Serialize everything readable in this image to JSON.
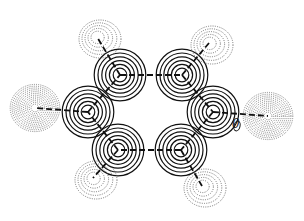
{
  "figure": {
    "type": "contour-map",
    "contour_label": "0",
    "line_color": "#111111",
    "negative_contour_color": "#555555"
  },
  "atoms": [
    {
      "id": "C1",
      "x": 120,
      "y": 75,
      "kind": "ring",
      "rings": 6
    },
    {
      "id": "C2",
      "x": 182,
      "y": 75,
      "kind": "ring",
      "rings": 6
    },
    {
      "id": "C3",
      "x": 88,
      "y": 112,
      "kind": "ring",
      "rings": 6
    },
    {
      "id": "C4",
      "x": 213,
      "y": 112,
      "kind": "ring",
      "rings": 6
    },
    {
      "id": "C5",
      "x": 118,
      "y": 150,
      "kind": "ring",
      "rings": 6
    },
    {
      "id": "C6",
      "x": 181,
      "y": 150,
      "kind": "ring",
      "rings": 6
    },
    {
      "id": "H1",
      "x": 97,
      "y": 37,
      "kind": "dotted",
      "rings": 5
    },
    {
      "id": "H2",
      "x": 209,
      "y": 43,
      "kind": "dotted",
      "rings": 5
    },
    {
      "id": "X1",
      "x": 35,
      "y": 108,
      "kind": "dotted-dense",
      "rings": 12
    },
    {
      "id": "X2",
      "x": 268,
      "y": 116,
      "kind": "dotted-dense",
      "rings": 12
    },
    {
      "id": "H3",
      "x": 93,
      "y": 178,
      "kind": "dotted",
      "rings": 5
    },
    {
      "id": "H4",
      "x": 202,
      "y": 186,
      "kind": "dotted",
      "rings": 5
    }
  ],
  "bonds": [
    [
      "C1",
      "C2"
    ],
    [
      "C2",
      "C4"
    ],
    [
      "C4",
      "C6"
    ],
    [
      "C6",
      "C5"
    ],
    [
      "C5",
      "C3"
    ],
    [
      "C3",
      "C1"
    ],
    [
      "C1",
      "H1"
    ],
    [
      "C2",
      "H2"
    ],
    [
      "C3",
      "X1"
    ],
    [
      "C4",
      "X2"
    ],
    [
      "C5",
      "H3"
    ],
    [
      "C6",
      "H4"
    ]
  ]
}
